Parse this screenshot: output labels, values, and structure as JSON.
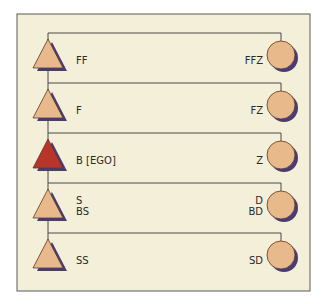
{
  "diagram": {
    "type": "kinship-chart",
    "background": "#f3efd8",
    "border_color": "#5a5a5a",
    "line_color": "#4a4a4a",
    "colors": {
      "male_fill": "#e8b98a",
      "ego_fill": "#b8352c",
      "female_fill": "#e8b98a",
      "shadow": "#4b3a78"
    },
    "rows": [
      {
        "male": {
          "labels": [
            "FF"
          ],
          "is_ego": false
        },
        "female": {
          "labels": [
            "FFZ"
          ]
        }
      },
      {
        "male": {
          "labels": [
            "F"
          ],
          "is_ego": false
        },
        "female": {
          "labels": [
            "FZ"
          ]
        }
      },
      {
        "male": {
          "labels": [
            "B [EGO]"
          ],
          "is_ego": true
        },
        "female": {
          "labels": [
            "Z"
          ]
        }
      },
      {
        "male": {
          "labels": [
            "S",
            "BS"
          ],
          "is_ego": false
        },
        "female": {
          "labels": [
            "D",
            "BD"
          ]
        }
      },
      {
        "male": {
          "labels": [
            "SS"
          ],
          "is_ego": false
        },
        "female": {
          "labels": [
            "SD"
          ]
        }
      }
    ]
  }
}
